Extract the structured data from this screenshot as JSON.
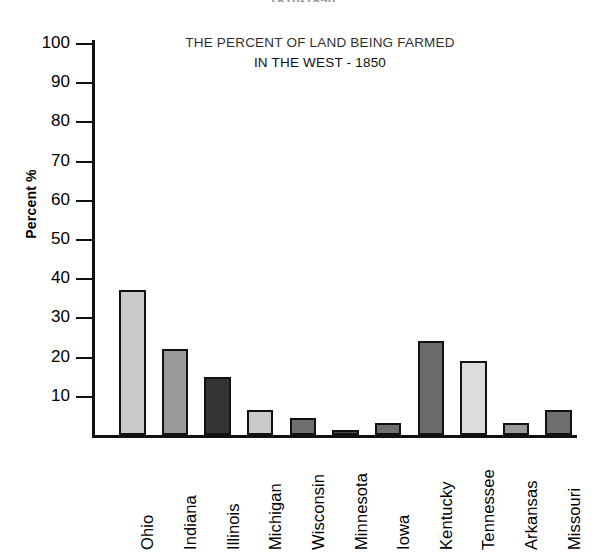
{
  "header": {
    "cropped_top_text": "1810-1850"
  },
  "chart_data": {
    "type": "bar",
    "title": "THE PERCENT OF LAND BEING FARMED IN THE WEST - 1850",
    "title_lines": [
      "THE PERCENT OF LAND BEING FARMED",
      "IN THE WEST - 1850"
    ],
    "xlabel": "",
    "ylabel": "Percent %",
    "ylim": [
      0,
      100
    ],
    "ytick_values": [
      10,
      20,
      30,
      40,
      50,
      60,
      70,
      80,
      90,
      100
    ],
    "ytick_labels": [
      "10",
      "20",
      "30",
      "40",
      "50",
      "60",
      "70",
      "80",
      "90",
      "100"
    ],
    "grid": false,
    "legend": false,
    "categories": [
      "Ohio",
      "Indiana",
      "Illinois",
      "Michigan",
      "Wisconsin",
      "Minnesota",
      "Iowa",
      "Kentucky",
      "Tennessee",
      "Arkansas",
      "Missouri"
    ],
    "values": [
      37,
      22,
      14.8,
      6.5,
      4.3,
      1,
      3,
      24,
      19,
      3,
      6.5
    ],
    "bar_colors": [
      "#c9c9c9",
      "#999999",
      "#333333",
      "#c9c9c9",
      "#6f6f6f",
      "#4a4a4a",
      "#6f6f6f",
      "#6a6a6a",
      "#dcdcdc",
      "#9a9a9a",
      "#6f6f6f"
    ],
    "bar_edge_color": "#111111",
    "axis_color": "#111111",
    "background_color": "#ffffff"
  }
}
